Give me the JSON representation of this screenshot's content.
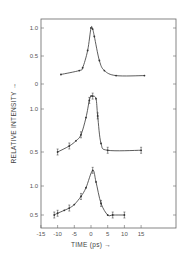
{
  "chart_data": {
    "type": "line",
    "title": "",
    "xlabel": "TIME (ps) →",
    "ylabel": "RELATIVE INTENSITY →",
    "xlim": [
      -15,
      20
    ],
    "x_ticks": [
      -15,
      -10,
      -5,
      0,
      5,
      10,
      15
    ],
    "x_tick_labels": [
      "-15",
      "-10",
      "-5",
      "0",
      "5",
      "10",
      "15"
    ],
    "grid": false,
    "legend": null,
    "panels": [
      {
        "name": "top",
        "y_ticks": [
          0,
          0.5,
          1.0
        ],
        "y_tick_labels": [
          "0",
          "0.5",
          "1.0"
        ],
        "ylim": [
          0,
          1.05
        ],
        "x": [
          -9,
          -3.5,
          -2.5,
          -1,
          0,
          0.5,
          1,
          2.5,
          4,
          7.5,
          16
        ],
        "y": [
          0.17,
          0.24,
          0.29,
          0.6,
          1.0,
          0.98,
          0.85,
          0.42,
          0.24,
          0.15,
          0.15
        ],
        "error_bars": false
      },
      {
        "name": "middle",
        "y_ticks": [
          0.5,
          1.0
        ],
        "y_tick_labels": [
          "0.5",
          "1.0"
        ],
        "ylim": [
          0.5,
          1.2
        ],
        "x": [
          -10,
          -6.5,
          -4.5,
          -3,
          -1.5,
          -0.5,
          0,
          0.5,
          1.5,
          2,
          3,
          5,
          15
        ],
        "y": [
          0.5,
          0.57,
          0.63,
          0.7,
          0.9,
          1.1,
          1.15,
          1.15,
          1.12,
          0.92,
          0.6,
          0.52,
          0.52
        ],
        "error_bars": true
      },
      {
        "name": "bottom",
        "y_ticks": [
          0.5,
          1.0
        ],
        "y_tick_labels": [
          "0.5",
          "1.0"
        ],
        "ylim": [
          0.4,
          1.35
        ],
        "x": [
          -11,
          -10,
          -8,
          -6.5,
          -5,
          -3,
          -1.5,
          0.5,
          1.5,
          3,
          5,
          6.5,
          10
        ],
        "y": [
          0.5,
          0.53,
          0.58,
          0.62,
          0.68,
          0.82,
          0.97,
          1.27,
          1.07,
          0.7,
          0.5,
          0.5,
          0.5
        ],
        "error_bars": true
      }
    ]
  },
  "colors": {
    "ink": "#333333",
    "frame": "#555555",
    "background": "#ffffff"
  }
}
